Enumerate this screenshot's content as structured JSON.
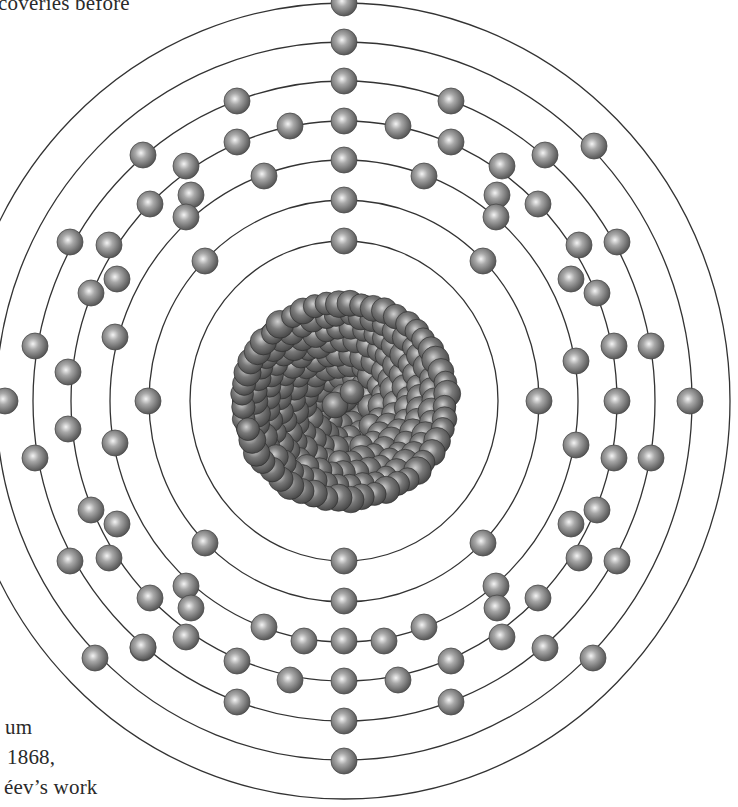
{
  "page": {
    "text_fragments": {
      "top": "coveries before",
      "bottom_line1": "um",
      "bottom_line2": "1868,",
      "bottom_line3": "éev’s  work"
    }
  },
  "diagram": {
    "type": "bohr-atom-model",
    "center": [
      344,
      401
    ],
    "nucleus": {
      "rx": 118,
      "ry": 112,
      "color": "#4a4a4a"
    },
    "shell_count": 7,
    "shells": [
      {
        "ry": 160,
        "rx": 154
      },
      {
        "ry": 201,
        "rx": 195
      },
      {
        "ry": 241,
        "rx": 234
      },
      {
        "ry": 280,
        "rx": 273
      },
      {
        "ry": 320,
        "rx": 311
      },
      {
        "ry": 359,
        "rx": 348
      },
      {
        "ry": 398,
        "rx": 386
      }
    ],
    "electron_color": "#707070",
    "electron_radius": 13,
    "line_color": "#333333"
  }
}
